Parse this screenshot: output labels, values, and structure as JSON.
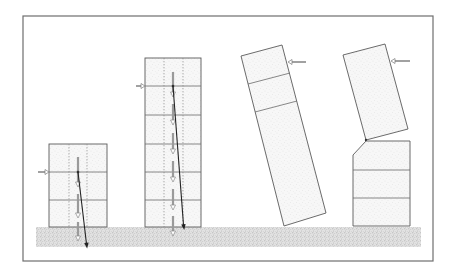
{
  "figure": {
    "type": "structural-stability-diagram",
    "colors": {
      "frame": "#6e6e6e",
      "outline": "#5a5a5a",
      "resultant": "#222222",
      "load_arrow": "#9a9a9a",
      "ground": "#bdbdbd"
    },
    "buildings": [
      {
        "id": "short-building",
        "floors": 3,
        "state": "stable",
        "lateral_arrow": true,
        "resultant_arrow": true,
        "load_arrows": 3
      },
      {
        "id": "tall-building",
        "floors": 6,
        "state": "stable",
        "lateral_arrow": true,
        "resultant_arrow": true,
        "load_arrows": 6
      },
      {
        "id": "overturning-building",
        "floors": 3,
        "state": "overturning",
        "lateral_arrow": true,
        "resultant_arrow": false
      },
      {
        "id": "broken-building",
        "floors": 4,
        "state": "failing-at-joint",
        "lateral_arrow": true,
        "resultant_arrow": false
      }
    ]
  }
}
